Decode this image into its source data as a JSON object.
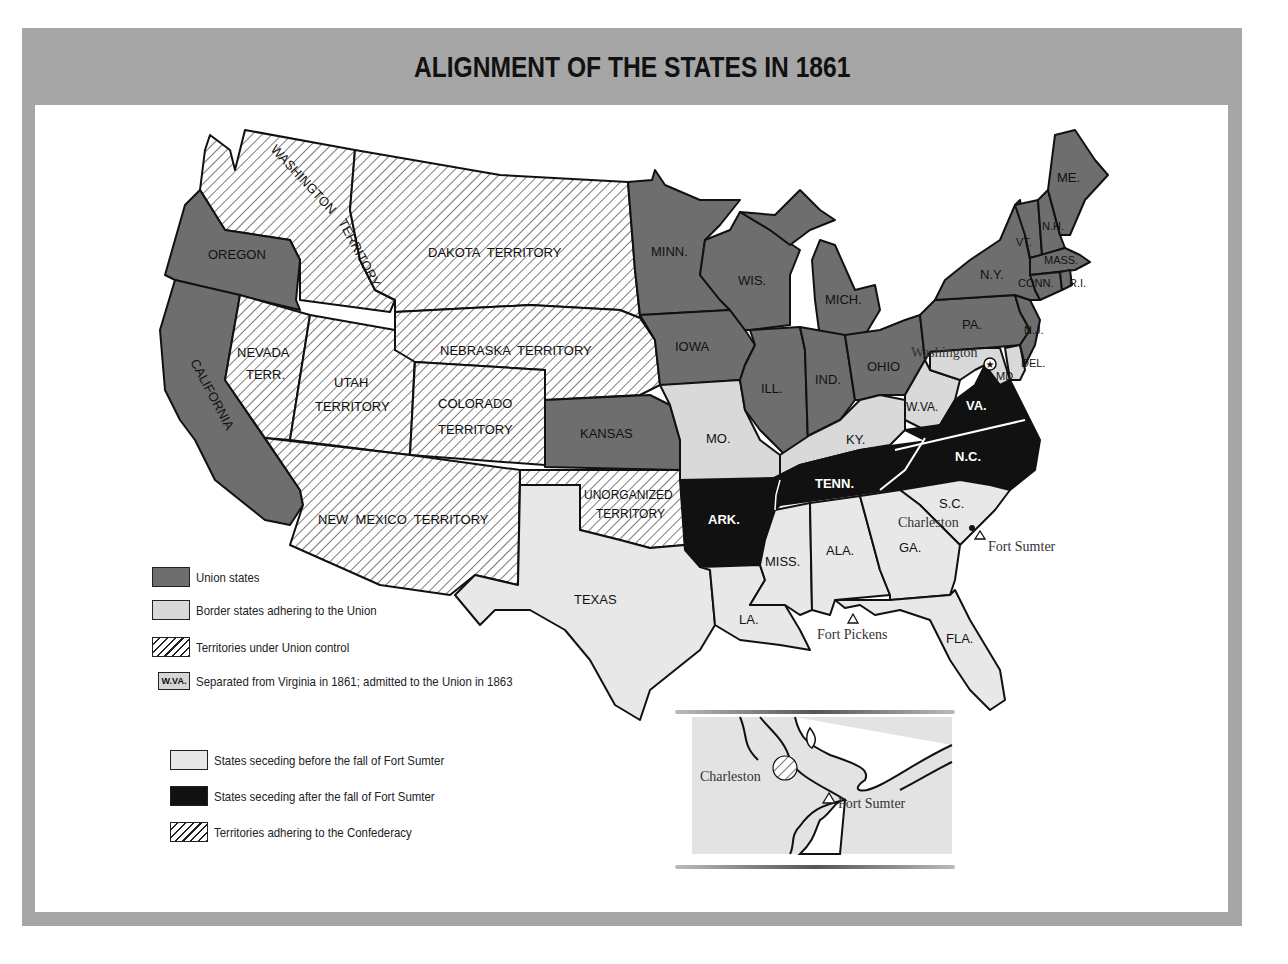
{
  "title": "ALIGNMENT OF THE STATES IN 1861",
  "colors": {
    "frame": "#a6a6a6",
    "union_states": "#6e6e6e",
    "border_states": "#d9d9d9",
    "seceded_before": "#e8e8e8",
    "seceded_after": "#111111",
    "territory_hatch": "#222222",
    "background": "#ffffff"
  },
  "map": {
    "union_states": [
      "OREGON",
      "CALIFORNIA",
      "MINN.",
      "WIS.",
      "MICH.",
      "IOWA",
      "ILL.",
      "IND.",
      "OHIO",
      "KANSAS",
      "PA.",
      "N.Y.",
      "N.J.",
      "VT.",
      "N.H.",
      "ME.",
      "MASS.",
      "CONN.",
      "R.I."
    ],
    "border_states": [
      "MO.",
      "KY.",
      "MD.",
      "DEL.",
      "W.VA."
    ],
    "territories_union": [
      "WASHINGTON TERRITORY",
      "DAKOTA TERRITORY",
      "NEBRASKA TERRITORY",
      "NEVADA TERR.",
      "UTAH TERRITORY",
      "COLORADO TERRITORY"
    ],
    "states_seceding_before": [
      "TEXAS",
      "LA.",
      "MISS.",
      "ALA.",
      "GA.",
      "FLA.",
      "S.C."
    ],
    "states_seceding_after": [
      "VA.",
      "N.C.",
      "TENN.",
      "ARK."
    ],
    "territories_confederacy": [
      "NEW MEXICO TERRITORY",
      "UNORGANIZED TERRITORY"
    ],
    "labels": {
      "washington": "WASHINGTON",
      "washington2": "TERRITORY",
      "oregon": "OREGON",
      "california": "CALIFORNIA",
      "dakota": "DAKOTA  TERRITORY",
      "nebraska": "NEBRASKA  TERRITORY",
      "nevada1": "NEVADA",
      "nevada2": "TERR.",
      "utah1": "UTAH",
      "utah2": "TERRITORY",
      "colorado1": "COLORADO",
      "colorado2": "TERRITORY",
      "kansas": "KANSAS",
      "newmexico": "NEW  MEXICO  TERRITORY",
      "unorg1": "UNORGANIZED",
      "unorg2": "TERRITORY",
      "texas": "TEXAS",
      "minn": "MINN.",
      "iowa": "IOWA",
      "mo": "MO.",
      "ark": "ARK.",
      "la": "LA.",
      "wis": "WIS.",
      "mich": "MICH.",
      "ill": "ILL.",
      "ind": "IND.",
      "ohio": "OHIO",
      "ky": "KY.",
      "tenn": "TENN.",
      "miss": "MISS.",
      "ala": "ALA.",
      "ga": "GA.",
      "fla": "FLA.",
      "sc": "S.C.",
      "nc": "N.C.",
      "va": "VA.",
      "wva": "W.VA.",
      "md": "MD.",
      "del": "DEL.",
      "pa": "PA.",
      "nj": "N.J.",
      "ny": "N.Y.",
      "vt": "VT.",
      "nh": "N.H.",
      "me": "ME.",
      "mass": "MASS.",
      "conn": "CONN.",
      "ri": "R.I."
    },
    "places": {
      "washington_dc": "Washington",
      "charleston": "Charleston",
      "fort_sumter": "Fort Sumter",
      "fort_pickens": "Fort Pickens"
    }
  },
  "legend_union": [
    {
      "swatch": "union",
      "label": "Union states"
    },
    {
      "swatch": "border",
      "label": "Border states adhering to the Union"
    },
    {
      "swatch": "terr",
      "label": "Territories under Union control"
    },
    {
      "swatch": "wva",
      "swatch_text": "W.VA.",
      "label": "Separated from Virginia in 1861; admitted to the Union in 1863"
    }
  ],
  "legend_confederacy": [
    {
      "swatch": "sec",
      "label": "States seceding before the fall of Fort Sumter"
    },
    {
      "swatch": "after",
      "label": "States seceding after the fall of Fort Sumter"
    },
    {
      "swatch": "terr",
      "label": "Territories adhering to the Confederacy"
    }
  ],
  "inset": {
    "charleston": "Charleston",
    "fort_sumter": "Fort Sumter"
  }
}
